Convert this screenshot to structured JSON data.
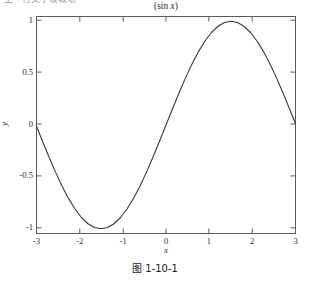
{
  "top_cropped_text": "上一行文字被裁切",
  "figure": {
    "title_prefix": "(sin ",
    "title_var": "x",
    "title_suffix": ")",
    "xlabel": "x",
    "ylabel": "y",
    "caption": "图 1-10-1",
    "line_color": "#3a3a3a",
    "axis_color": "#5a5a5a",
    "background": "#ffffff"
  },
  "chart_data": {
    "type": "line",
    "title": "(sin x)",
    "xlabel": "x",
    "ylabel": "y",
    "xlim": [
      -3.14159,
      3.14159
    ],
    "ylim": [
      -1.05,
      1.05
    ],
    "grid": false,
    "legend": null,
    "xticks": [
      -3,
      -2,
      -1,
      0,
      1,
      2,
      3
    ],
    "xtick_labels": [
      "-3",
      "-2",
      "-1",
      "0",
      "1",
      "2",
      "3"
    ],
    "yticks": [
      -1,
      -0.5,
      0,
      0.5,
      1
    ],
    "ytick_labels": [
      "-1",
      "-0.5",
      "0",
      "0.5",
      "1"
    ],
    "series": [
      {
        "name": "sin(x)",
        "color": "#3a3a3a",
        "x": [
          -3.14159,
          -2.98451,
          -2.82743,
          -2.67035,
          -2.51327,
          -2.35619,
          -2.19911,
          -2.04204,
          -1.88496,
          -1.72788,
          -1.5708,
          -1.41372,
          -1.25664,
          -1.09956,
          -0.94248,
          -0.7854,
          -0.62832,
          -0.47124,
          -0.31416,
          -0.15708,
          0,
          0.15708,
          0.31416,
          0.47124,
          0.62832,
          0.7854,
          0.94248,
          1.09956,
          1.25664,
          1.41372,
          1.5708,
          1.72788,
          1.88496,
          2.04204,
          2.19911,
          2.35619,
          2.51327,
          2.67035,
          2.82743,
          2.98451,
          3.14159
        ],
        "y": [
          0,
          -0.1564,
          -0.309,
          -0.454,
          -0.5878,
          -0.7071,
          -0.809,
          -0.891,
          -0.9511,
          -0.9877,
          -1,
          -0.9877,
          -0.9511,
          -0.891,
          -0.809,
          -0.7071,
          -0.5878,
          -0.454,
          -0.309,
          -0.1564,
          0,
          0.1564,
          0.309,
          0.454,
          0.5878,
          0.7071,
          0.809,
          0.891,
          0.9511,
          0.9877,
          1,
          0.9877,
          0.9511,
          0.891,
          0.809,
          0.7071,
          0.5878,
          0.454,
          0.309,
          0.1564,
          0
        ]
      }
    ],
    "annotations": [
      {
        "label": "minimum",
        "x": -1.5708,
        "y": -1
      },
      {
        "label": "maximum",
        "x": 1.5708,
        "y": 1
      },
      {
        "label": "zero-crossing",
        "x": 0,
        "y": 0
      }
    ]
  }
}
